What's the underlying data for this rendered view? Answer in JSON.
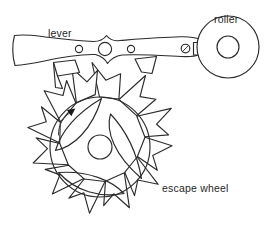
{
  "diagram": {
    "background_color": "#ffffff",
    "line_color": "#2b2b2b",
    "labels": {
      "lever": "lever",
      "roller": "roller",
      "escape_wheel": "escape wheel"
    },
    "parts": {
      "lever_name": "lever",
      "roller_name": "roller",
      "escape_wheel_name": "escape wheel",
      "entry_pallet_name": "entry pallet stone",
      "exit_pallet_name": "exit pallet stone",
      "guard_pin_name": "guard pin",
      "fork_slot_name": "fork notch",
      "impulse_jewel_name": "impulse jewel",
      "arrow_name": "rotation direction arrow"
    },
    "geometry": {
      "escape_wheel_center_x": 100,
      "escape_wheel_center_y": 147,
      "escape_wheel_rim_radius": 50,
      "escape_wheel_tooth_tip_radius": 72,
      "escape_wheel_tooth_count": 15,
      "escape_wheel_hub_radius": 12,
      "roller_center_x": 228,
      "roller_center_y": 47,
      "roller_outer_radius": 31,
      "roller_hole_radius": 11,
      "lever_hole_left_x": 79,
      "lever_hole_left_r": 3.5,
      "lever_hole_center_x": 105,
      "lever_hole_center_r": 6.5,
      "lever_hole_right_x": 131,
      "lever_hole_right_r": 3.5,
      "lever_axis_y": 49
    },
    "rotation": {
      "direction": "counter-clockwise",
      "arrow_label": ""
    }
  }
}
